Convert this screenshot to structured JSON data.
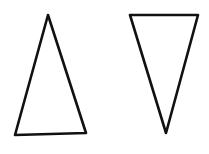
{
  "canvas": {
    "width": 209,
    "height": 154,
    "background": "#ffffff"
  },
  "stroke": {
    "color": "#111111",
    "width": 2.6
  },
  "shapes": [
    {
      "name": "upright-triangle",
      "points": "48,15 15,135 86,133"
    },
    {
      "name": "inverted-triangle",
      "points": "130,15 198,15 166,133"
    }
  ]
}
